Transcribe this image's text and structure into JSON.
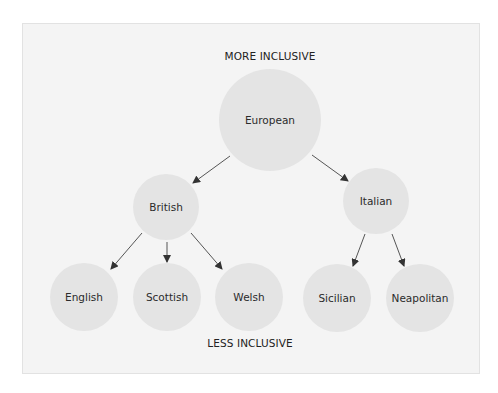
{
  "diagram": {
    "top_label": "MORE INCLUSIVE",
    "bottom_label": "LESS INCLUSIVE",
    "colors": {
      "panel_bg": "#f4f4f4",
      "node_fill": "#e4e4e4",
      "edge": "#555555",
      "text": "#2b2b2b"
    },
    "nodes": [
      {
        "id": "european",
        "label": "European",
        "level": 0,
        "cx": 270,
        "cy": 120,
        "r": 51
      },
      {
        "id": "british",
        "label": "British",
        "level": 1,
        "cx": 166,
        "cy": 207,
        "r": 33
      },
      {
        "id": "italian",
        "label": "Italian",
        "level": 1,
        "cx": 376,
        "cy": 201,
        "r": 33
      },
      {
        "id": "english",
        "label": "English",
        "level": 2,
        "cx": 84,
        "cy": 297,
        "r": 34
      },
      {
        "id": "scottish",
        "label": "Scottish",
        "level": 2,
        "cx": 167,
        "cy": 297,
        "r": 34
      },
      {
        "id": "welsh",
        "label": "Welsh",
        "level": 2,
        "cx": 249,
        "cy": 297,
        "r": 34
      },
      {
        "id": "sicilian",
        "label": "Sicilian",
        "level": 2,
        "cx": 337,
        "cy": 298,
        "r": 34
      },
      {
        "id": "neapolitan",
        "label": "Neapolitan",
        "level": 2,
        "cx": 420,
        "cy": 298,
        "r": 34
      }
    ],
    "edges": [
      {
        "from": "european",
        "to": "british",
        "x1": 230,
        "y1": 156,
        "x2": 193,
        "y2": 183
      },
      {
        "from": "european",
        "to": "italian",
        "x1": 312,
        "y1": 155,
        "x2": 348,
        "y2": 181
      },
      {
        "from": "british",
        "to": "english",
        "x1": 142,
        "y1": 233,
        "x2": 111,
        "y2": 269
      },
      {
        "from": "british",
        "to": "scottish",
        "x1": 167,
        "y1": 242,
        "x2": 167,
        "y2": 262
      },
      {
        "from": "british",
        "to": "welsh",
        "x1": 191,
        "y1": 233,
        "x2": 222,
        "y2": 269
      },
      {
        "from": "italian",
        "to": "sicilian",
        "x1": 365,
        "y1": 234,
        "x2": 353,
        "y2": 266
      },
      {
        "from": "italian",
        "to": "neapolitan",
        "x1": 392,
        "y1": 234,
        "x2": 404,
        "y2": 266
      }
    ]
  }
}
